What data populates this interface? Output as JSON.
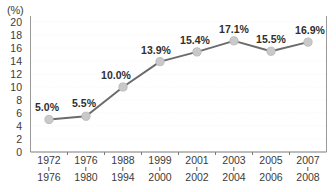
{
  "chart_data": {
    "type": "line",
    "title": "",
    "subtitle": "",
    "xlabel": "",
    "ylabel": "(%)",
    "unit_label": "(%)",
    "ylim": [
      0,
      20
    ],
    "yticks": [
      20,
      18,
      16,
      14,
      12,
      10,
      8,
      6,
      4,
      2,
      0
    ],
    "ytick_labels": [
      "20",
      "18",
      "16",
      "14",
      "12",
      "10",
      "8",
      "6",
      "4",
      "2",
      "0"
    ],
    "grid": true,
    "legend": null,
    "legend_position": "none",
    "categories": [
      "1972\n1976",
      "1976\n1980",
      "1988\n1994",
      "1999\n2000",
      "2001\n2002",
      "2003\n2004",
      "2005\n2006",
      "2007\n2008"
    ],
    "x_tick_labels": [
      {
        "top": "1972",
        "bottom": "1976"
      },
      {
        "top": "1976",
        "bottom": "1980"
      },
      {
        "top": "1988",
        "bottom": "1994"
      },
      {
        "top": "1999",
        "bottom": "2000"
      },
      {
        "top": "2001",
        "bottom": "2002"
      },
      {
        "top": "2003",
        "bottom": "2004"
      },
      {
        "top": "2005",
        "bottom": "2006"
      },
      {
        "top": "2007",
        "bottom": "2008"
      }
    ],
    "values": [
      5.0,
      5.5,
      10.0,
      13.9,
      15.4,
      17.1,
      15.5,
      16.9
    ],
    "data_labels": [
      "5.0%",
      "5.5%",
      "10.0%",
      "13.9%",
      "15.4%",
      "17.1%",
      "15.5%",
      "16.9%"
    ],
    "series": [
      {
        "name": "",
        "values": [
          5.0,
          5.5,
          10.0,
          13.9,
          15.4,
          17.1,
          15.5,
          16.9
        ]
      }
    ],
    "colors": {
      "line": "#6b6b6b",
      "marker_fill": "#c9c9c9",
      "marker_stroke": "#bdbdbd",
      "axis": "#9a9a9a",
      "grid": "#f1f1f1",
      "text": "#3b3b3b",
      "background": "#ffffff"
    }
  }
}
